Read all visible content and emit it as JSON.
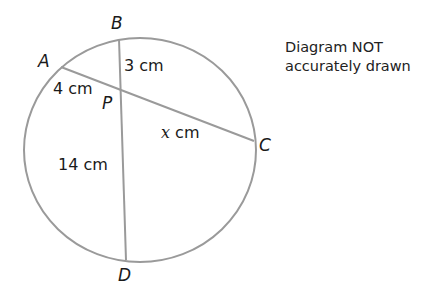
{
  "diagram": {
    "points": {
      "A": "A",
      "B": "B",
      "C": "C",
      "D": "D",
      "P": "P"
    },
    "lengths": {
      "BP": "3 cm",
      "AP": "4 cm",
      "PC_var": "x",
      "PC_unit": " cm",
      "PD": "14 cm"
    },
    "note": {
      "line1": "Diagram NOT",
      "line2": "accurately drawn"
    },
    "colors": {
      "stroke": "#9a9a9a",
      "text": "#1a1a1a"
    }
  }
}
